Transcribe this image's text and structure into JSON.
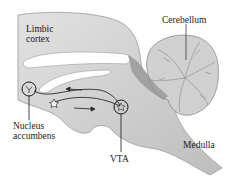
{
  "diagram": {
    "type": "brain-sagittal-section",
    "labels": {
      "limbic_cortex": [
        "Limbic",
        "cortex"
      ],
      "cerebellum": "Cerebellum",
      "nucleus_accumbens": [
        "Nucleus",
        "accumbens"
      ],
      "vta": "VTA",
      "medulla": "Medulla"
    },
    "pathway": {
      "from": "VTA",
      "to": "Nucleus accumbens",
      "arrows": [
        "toward-nucleus-accumbens",
        "toward-vta"
      ]
    },
    "colors": {
      "brain_fill": "#c9c9c9",
      "brain_light": "#dedede",
      "brain_dark": "#8e8e8e",
      "ventricle": "#ffffff",
      "line": "#2a2a2a"
    }
  }
}
